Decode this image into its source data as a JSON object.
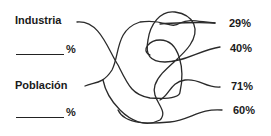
{
  "left_items": [
    {
      "label": "Industria",
      "blank_suffix": "%"
    },
    {
      "label": "Población",
      "blank_suffix": "%"
    }
  ],
  "right_values": [
    "29%",
    "40%",
    "71%",
    "60%"
  ],
  "colors": {
    "line": "#2a2a2a",
    "text": "#1a1a1a",
    "background": "#ffffff"
  }
}
